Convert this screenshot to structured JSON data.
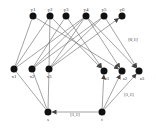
{
  "diagram": {
    "nodes": [
      {
        "id": "y1",
        "label": "y1",
        "x": 33,
        "y": 16,
        "lx": 0,
        "ly": -5
      },
      {
        "id": "y2",
        "label": "y2",
        "x": 50,
        "y": 16,
        "lx": 0,
        "ly": -5
      },
      {
        "id": "y3",
        "label": "y3",
        "x": 66,
        "y": 16,
        "lx": 0,
        "ly": -5
      },
      {
        "id": "y4",
        "label": "y4",
        "x": 86,
        "y": 16,
        "lx": 0,
        "ly": -5
      },
      {
        "id": "y5",
        "label": "y5",
        "x": 104,
        "y": 16,
        "lx": 0,
        "ly": -5
      },
      {
        "id": "y6",
        "label": "y6",
        "x": 122,
        "y": 16,
        "lx": 0,
        "ly": -5
      },
      {
        "id": "x1",
        "label": "x1",
        "x": 14,
        "y": 69,
        "lx": 0,
        "ly": 9
      },
      {
        "id": "x2",
        "label": "x2",
        "x": 32,
        "y": 69,
        "lx": 0,
        "ly": 9
      },
      {
        "id": "x3",
        "label": "x3",
        "x": 49,
        "y": 69,
        "lx": 0,
        "ly": 9
      },
      {
        "id": "z1",
        "label": "z1",
        "x": 104,
        "y": 71,
        "lx": 3,
        "ly": 9
      },
      {
        "id": "z2",
        "label": "z2",
        "x": 122,
        "y": 71,
        "lx": 3,
        "ly": 9
      },
      {
        "id": "z3",
        "label": "z3",
        "x": 139,
        "y": 71,
        "lx": 3,
        "ly": 9
      },
      {
        "id": "s",
        "label": "s",
        "x": 48,
        "y": 112,
        "lx": 0,
        "ly": 9
      },
      {
        "id": "t",
        "label": "t",
        "x": 102,
        "y": 112,
        "lx": 0,
        "ly": 9
      }
    ],
    "edges": [
      {
        "from": "x1",
        "to": "y1",
        "arrow": false
      },
      {
        "from": "x1",
        "to": "y2",
        "arrow": false
      },
      {
        "from": "x1",
        "to": "y4",
        "arrow": false
      },
      {
        "from": "x2",
        "to": "y3",
        "arrow": false
      },
      {
        "from": "x2",
        "to": "y4",
        "arrow": false
      },
      {
        "from": "x2",
        "to": "y5",
        "arrow": false
      },
      {
        "from": "x3",
        "to": "y2",
        "arrow": false
      },
      {
        "from": "x3",
        "to": "y4",
        "arrow": false
      },
      {
        "from": "x3",
        "to": "y5",
        "arrow": false
      },
      {
        "from": "x3",
        "to": "y6",
        "arrow": true
      },
      {
        "from": "y1",
        "to": "z2",
        "arrow": true
      },
      {
        "from": "y2",
        "to": "z1",
        "arrow": true
      },
      {
        "from": "y3",
        "to": "z1",
        "arrow": true
      },
      {
        "from": "y4",
        "to": "z2",
        "arrow": true
      },
      {
        "from": "y4",
        "to": "z3",
        "arrow": true
      },
      {
        "from": "y5",
        "to": "z3",
        "arrow": true
      },
      {
        "from": "x1",
        "to": "s",
        "arrow": false,
        "rev": true
      },
      {
        "from": "x2",
        "to": "s",
        "arrow": false
      },
      {
        "from": "x3",
        "to": "s",
        "arrow": false
      },
      {
        "from": "t",
        "to": "z1",
        "arrow": true
      },
      {
        "from": "t",
        "to": "z2",
        "arrow": true
      },
      {
        "from": "t",
        "to": "z3",
        "arrow": true
      },
      {
        "from": "t",
        "to": "s",
        "arrow": true
      }
    ],
    "edge_labels": [
      {
        "text": "[0,1]",
        "x": 133,
        "y": 41
      },
      {
        "text": "[1,1]",
        "x": 129,
        "y": 96
      },
      {
        "text": "[1,1]",
        "x": 75,
        "y": 116
      }
    ]
  }
}
